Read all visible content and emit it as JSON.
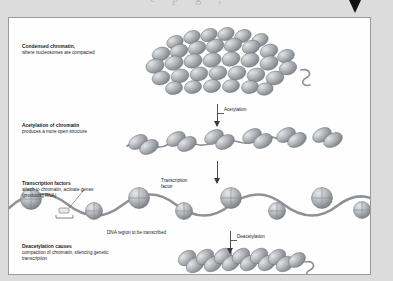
{
  "page": {
    "background_color": "#dcdcdc",
    "panel_color": "#fefefe",
    "panel_border_color": "#9a9a9a",
    "ghost_text": "e  p  g  ,",
    "top_arrow_icon": "down-triangle-icon"
  },
  "figure": {
    "nucleosome_color": "#a9adb1",
    "nucleosome_highlight": "#d7dadd",
    "nucleosome_shadow": "#74787c",
    "dna_color": "#8e9296",
    "arrow_color": "#3a3a3a",
    "stages": [
      {
        "id": "condensed-chromatin",
        "heading": "Condensed chromatin,",
        "body": "where nucleosomes are compacted",
        "nucleosome_count": 26,
        "arrangement": "dense-cluster"
      },
      {
        "id": "acetylated-chromatin",
        "heading": "Acetylation of chromatin",
        "body": "produces a more open structure",
        "nucleosome_count": 6,
        "arrangement": "open-beads-on-string"
      },
      {
        "id": "transcription-factors",
        "heading": "Transcription factors",
        "body": "attach to chromatin, activate genes (producing RNA)",
        "nucleosome_count": 8,
        "arrangement": "wavy-strand-spheres"
      },
      {
        "id": "deacetylated-chromatin",
        "heading": "Deacetylation causes",
        "body": "compaction of chromatin, silencing genetic transcription",
        "nucleosome_count": 6,
        "arrangement": "tight-coil"
      }
    ],
    "process_labels": {
      "acetylation": "Acetylation",
      "deacetylation": "Deacetylation"
    },
    "callouts": {
      "transcription_factor": "Transcription factor",
      "dna_region": "DNA region to be transcribed"
    }
  }
}
